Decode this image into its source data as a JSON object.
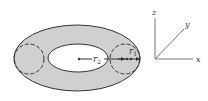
{
  "diagram": {
    "type": "torus-cross-section",
    "fill_color": "#d0d0d0",
    "stroke_color": "#333333",
    "labels": {
      "inner_radius": "r",
      "inner_radius_sub": "2",
      "tube_radius": "r",
      "tube_radius_sub": "1"
    },
    "axes": {
      "x_label": "x",
      "y_label": "y",
      "z_label": "z"
    }
  }
}
